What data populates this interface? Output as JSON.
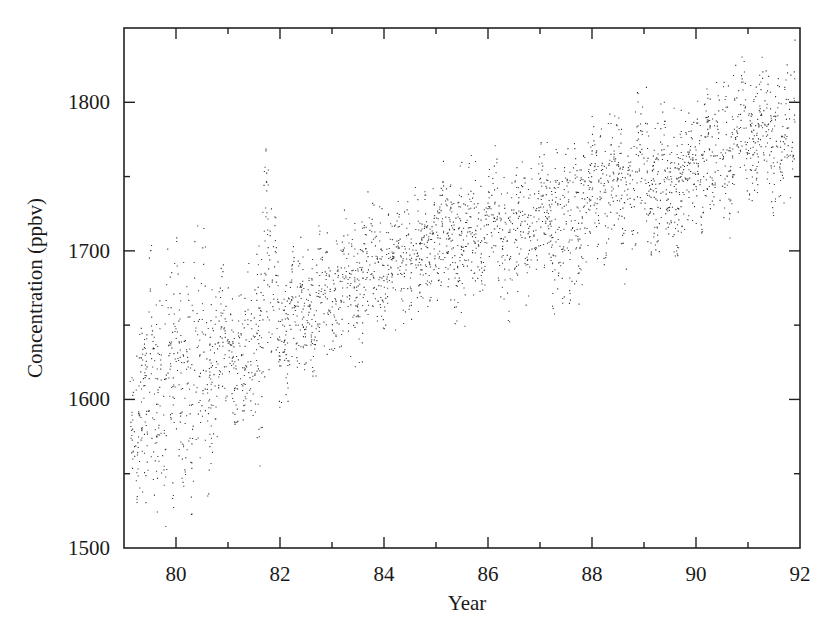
{
  "chart_data": {
    "type": "scatter",
    "title": "",
    "xlabel": "Year",
    "ylabel": "Concentration (ppbv)",
    "xlim": [
      79,
      92
    ],
    "ylim": [
      1500,
      1850
    ],
    "x_ticks": [
      80,
      82,
      84,
      86,
      88,
      90,
      92
    ],
    "x_tick_labels": [
      "80",
      "82",
      "84",
      "86",
      "88",
      "90",
      "92"
    ],
    "x_minor_ticks": [
      81,
      83,
      85,
      87,
      89,
      91
    ],
    "y_ticks": [
      1500,
      1600,
      1700,
      1800
    ],
    "y_tick_labels": [
      "1500",
      "1600",
      "1700",
      "1800"
    ],
    "y_minor_ticks": [
      1550,
      1650,
      1750
    ],
    "grid": false,
    "legend": null,
    "marker_color": "#111111",
    "series": [
      {
        "name": "Concentration",
        "trend_points": {
          "x": [
            79.1,
            79.5,
            80.0,
            80.5,
            81.0,
            81.5,
            81.7,
            82.0,
            82.5,
            83.0,
            83.5,
            84.0,
            84.5,
            85.0,
            85.5,
            86.0,
            86.5,
            87.0,
            87.5,
            88.0,
            88.5,
            89.0,
            89.5,
            90.0,
            90.5,
            91.0,
            91.5,
            91.9
          ],
          "center": [
            1595,
            1605,
            1610,
            1620,
            1635,
            1625,
            1690,
            1650,
            1660,
            1670,
            1685,
            1690,
            1695,
            1710,
            1705,
            1720,
            1710,
            1725,
            1715,
            1745,
            1740,
            1755,
            1740,
            1760,
            1765,
            1785,
            1775,
            1780
          ],
          "upper": [
            1665,
            1705,
            1725,
            1725,
            1690,
            1700,
            1775,
            1700,
            1715,
            1720,
            1750,
            1730,
            1745,
            1770,
            1760,
            1775,
            1760,
            1775,
            1770,
            1800,
            1790,
            1820,
            1800,
            1810,
            1815,
            1845,
            1820,
            1845
          ],
          "lower": [
            1535,
            1520,
            1505,
            1520,
            1590,
            1555,
            1550,
            1590,
            1595,
            1630,
            1620,
            1630,
            1650,
            1665,
            1645,
            1680,
            1645,
            1680,
            1630,
            1700,
            1665,
            1700,
            1690,
            1710,
            1690,
            1735,
            1700,
            1710
          ]
        }
      }
    ]
  }
}
